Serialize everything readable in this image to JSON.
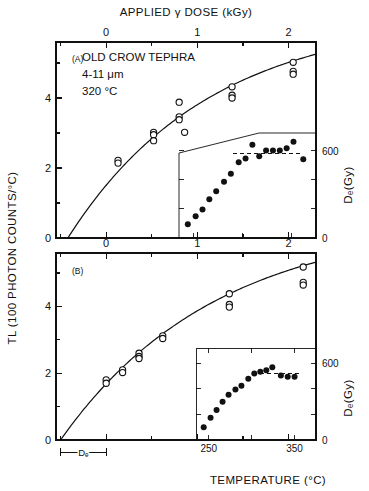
{
  "figure": {
    "top_axis_title": "APPLIED γ DOSE (kGy)",
    "left_axis_title": "TL (100 PHOTON COUNTS/°C)",
    "bottom_axis_title": "TEMPERATURE (°C)",
    "right_axis_title": "Dₑ(Gy)",
    "de_bracket_label": "Dₑ",
    "line_color": "#111111",
    "open_marker_color": "#ffffff",
    "filled_marker_color": "#111111"
  },
  "panelA": {
    "id": "(A)",
    "annotations": [
      "OLD CROW TEPHRA",
      "4-11 μm",
      "320 °C"
    ],
    "x_ticks": [
      "0",
      "1",
      "2"
    ],
    "y_ticks": [
      "0",
      "2",
      "4"
    ],
    "inset_right_ticks": [
      "0",
      "600"
    ]
  },
  "panelB": {
    "id": "(B)",
    "x_ticks": [
      "0",
      "1",
      "2"
    ],
    "y_ticks": [
      "0",
      "2",
      "4"
    ],
    "inset_x_ticks": [
      "250",
      "350"
    ],
    "inset_right_ticks": [
      "0",
      "600"
    ]
  },
  "chart_data": [
    {
      "type": "scatter",
      "panel": "A",
      "title": "OLD CROW TEPHRA 4-11 μm, 320 °C",
      "xlabel": "APPLIED γ DOSE (kGy)",
      "ylabel": "TL (100 PHOTON COUNTS/°C)",
      "xlim": [
        -0.55,
        2.3
      ],
      "ylim": [
        0,
        5.6
      ],
      "grid": false,
      "marker": "open-circle",
      "points": [
        {
          "x": 0.13,
          "y": 2.22
        },
        {
          "x": 0.13,
          "y": 2.14
        },
        {
          "x": 0.52,
          "y": 3.02
        },
        {
          "x": 0.52,
          "y": 2.95
        },
        {
          "x": 0.52,
          "y": 2.78
        },
        {
          "x": 0.8,
          "y": 3.88
        },
        {
          "x": 0.8,
          "y": 3.46
        },
        {
          "x": 0.8,
          "y": 3.38
        },
        {
          "x": 0.86,
          "y": 3.02
        },
        {
          "x": 1.38,
          "y": 4.32
        },
        {
          "x": 1.38,
          "y": 4.08
        },
        {
          "x": 1.38,
          "y": 4.0
        },
        {
          "x": 2.05,
          "y": 5.02
        },
        {
          "x": 2.05,
          "y": 4.76
        },
        {
          "x": 2.05,
          "y": 4.68
        }
      ],
      "fit_curve": {
        "description": "saturating exponential through origin-offset -De",
        "de": 0.42,
        "amplitude": 6.35,
        "d0": 1.55
      },
      "inset": {
        "type": "scatter",
        "xlabel": "TEMPERATURE (°C)",
        "ylabel": "Dₑ(Gy)",
        "xlim": [
          235,
          375
        ],
        "ylim": [
          0,
          720
        ],
        "right_ticks": [
          0,
          600
        ],
        "dashed_line_value": 580,
        "marker": "filled-circle",
        "points": [
          {
            "x": 244,
            "y": 95
          },
          {
            "x": 252,
            "y": 150
          },
          {
            "x": 259,
            "y": 195
          },
          {
            "x": 266,
            "y": 265
          },
          {
            "x": 273,
            "y": 320
          },
          {
            "x": 281,
            "y": 385
          },
          {
            "x": 288,
            "y": 440
          },
          {
            "x": 296,
            "y": 520
          },
          {
            "x": 303,
            "y": 545
          },
          {
            "x": 310,
            "y": 640
          },
          {
            "x": 317,
            "y": 560
          },
          {
            "x": 324,
            "y": 600
          },
          {
            "x": 331,
            "y": 600
          },
          {
            "x": 338,
            "y": 600
          },
          {
            "x": 345,
            "y": 615
          },
          {
            "x": 352,
            "y": 660
          },
          {
            "x": 362,
            "y": 540
          }
        ]
      }
    },
    {
      "type": "scatter",
      "panel": "B",
      "xlabel": "APPLIED γ DOSE (kGy)",
      "ylabel": "TL (100 PHOTON COUNTS/°C)",
      "xlim": [
        -0.55,
        2.3
      ],
      "ylim": [
        0,
        5.6
      ],
      "grid": false,
      "marker": "open-circle",
      "points": [
        {
          "x": 0.0,
          "y": 1.8
        },
        {
          "x": 0.0,
          "y": 1.7
        },
        {
          "x": 0.18,
          "y": 2.1
        },
        {
          "x": 0.18,
          "y": 2.02
        },
        {
          "x": 0.36,
          "y": 2.6
        },
        {
          "x": 0.36,
          "y": 2.5
        },
        {
          "x": 0.36,
          "y": 2.44
        },
        {
          "x": 0.62,
          "y": 3.12
        },
        {
          "x": 0.62,
          "y": 3.04
        },
        {
          "x": 1.35,
          "y": 4.38
        },
        {
          "x": 1.35,
          "y": 4.06
        },
        {
          "x": 1.35,
          "y": 3.98
        },
        {
          "x": 2.16,
          "y": 5.18
        },
        {
          "x": 2.16,
          "y": 4.72
        },
        {
          "x": 2.16,
          "y": 4.64
        }
      ],
      "fit_curve": {
        "description": "saturating exponential through origin-offset -De",
        "de": 0.5,
        "amplitude": 6.6,
        "d0": 1.7
      },
      "inset": {
        "type": "scatter",
        "xlabel": "TEMPERATURE (°C)",
        "ylabel": "Dₑ(Gy)",
        "xlim": [
          235,
          375
        ],
        "ylim": [
          0,
          720
        ],
        "right_ticks": [
          0,
          600
        ],
        "dashed_line_value": 520,
        "marker": "filled-circle",
        "points": [
          {
            "x": 244,
            "y": 100
          },
          {
            "x": 252,
            "y": 175
          },
          {
            "x": 259,
            "y": 235
          },
          {
            "x": 266,
            "y": 300
          },
          {
            "x": 273,
            "y": 355
          },
          {
            "x": 281,
            "y": 395
          },
          {
            "x": 288,
            "y": 425
          },
          {
            "x": 296,
            "y": 480
          },
          {
            "x": 303,
            "y": 520
          },
          {
            "x": 310,
            "y": 535
          },
          {
            "x": 317,
            "y": 545
          },
          {
            "x": 324,
            "y": 570
          },
          {
            "x": 334,
            "y": 505
          },
          {
            "x": 342,
            "y": 495
          },
          {
            "x": 350,
            "y": 495
          }
        ]
      }
    }
  ]
}
